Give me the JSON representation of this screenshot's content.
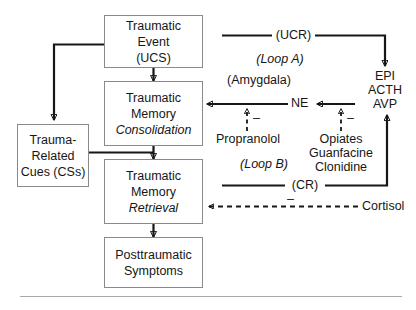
{
  "diagram": {
    "title_present": false,
    "colors": {
      "box_border": "#8a8a8a",
      "line": "#171717",
      "text": "#161616",
      "rule": "#a9a9a9",
      "background": "#ffffff"
    },
    "boxes": [
      {
        "id": "traumatic-event",
        "lines": [
          "Traumatic",
          "Event",
          "(UCS)"
        ],
        "italic_lines": []
      },
      {
        "id": "traumatic-memory-consolidation",
        "lines": [
          "Traumatic",
          "Memory",
          "Consolidation"
        ],
        "italic_lines": [
          "Consolidation"
        ]
      },
      {
        "id": "trauma-related-cues",
        "lines": [
          "Trauma-",
          "Related",
          "Cues (CSs)"
        ],
        "italic_lines": []
      },
      {
        "id": "traumatic-memory-retrieval",
        "lines": [
          "Traumatic",
          "Memory",
          "Retrieval"
        ],
        "italic_lines": [
          "Retrieval"
        ]
      },
      {
        "id": "posttraumatic-symptoms",
        "lines": [
          "Posttraumatic",
          "Symptoms"
        ],
        "italic_lines": []
      }
    ],
    "labels": {
      "ucr": "(UCR)",
      "loop_a": "(Loop A)",
      "amygdala": "(Amygdala)",
      "ne": "NE",
      "epi": "EPI",
      "acth": "ACTH",
      "avp": "AVP",
      "propranolol": "Propranolol",
      "opiates": "Opiates",
      "guanfacine": "Guanfacine",
      "clonidine": "Clonidine",
      "loop_b": "(Loop B)",
      "cr": "(CR)",
      "cortisol": "Cortisol",
      "minus_sign": "–"
    }
  }
}
